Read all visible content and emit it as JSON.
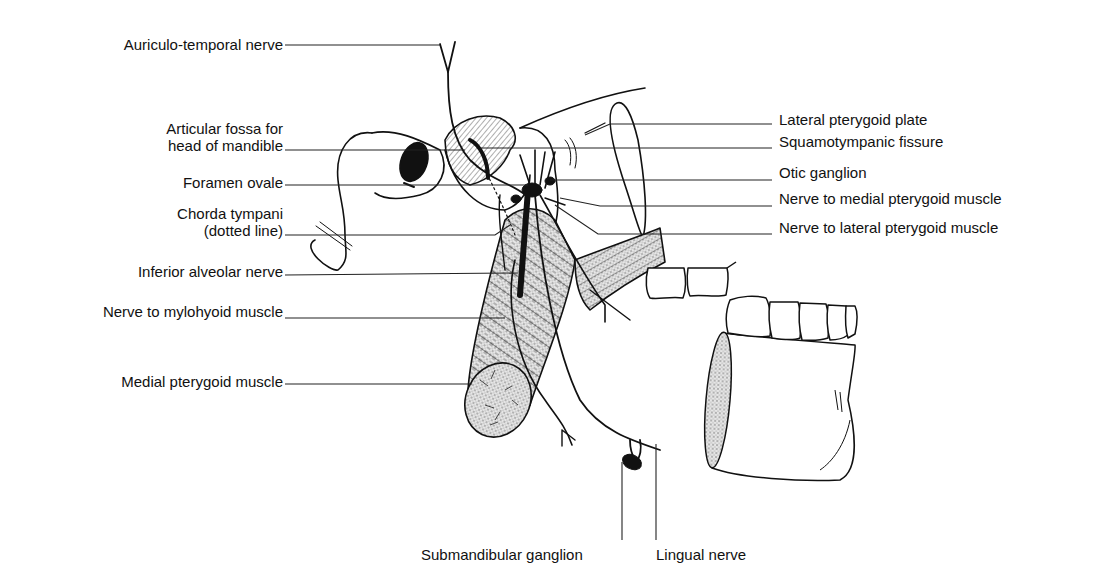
{
  "figure": {
    "line_color": "#111111",
    "shade_color": "#d9d9d9"
  },
  "labels": {
    "left": [
      {
        "id": "auriculo-temporal-nerve",
        "text": "Auriculo-temporal nerve"
      },
      {
        "id": "articular-fossa",
        "line1": "Articular fossa for",
        "line2": "head of mandible"
      },
      {
        "id": "foramen-ovale",
        "text": "Foramen ovale"
      },
      {
        "id": "chorda-tympani",
        "line1": "Chorda tympani",
        "line2": "(dotted line)"
      },
      {
        "id": "inferior-alveolar-nerve",
        "text": "Inferior alveolar nerve"
      },
      {
        "id": "nerve-to-mylohyoid",
        "text": "Nerve to mylohyoid muscle"
      },
      {
        "id": "medial-pterygoid-muscle",
        "text": "Medial pterygoid muscle"
      }
    ],
    "right": [
      {
        "id": "lateral-pterygoid-plate",
        "text": "Lateral pterygoid plate"
      },
      {
        "id": "squamotympanic-fissure",
        "text": "Squamotympanic fissure"
      },
      {
        "id": "otic-ganglion",
        "text": "Otic ganglion"
      },
      {
        "id": "nerve-to-medial-pterygoid",
        "text": "Nerve to medial pterygoid muscle"
      },
      {
        "id": "nerve-to-lateral-pterygoid",
        "text": "Nerve to lateral pterygoid muscle"
      }
    ],
    "bottom": [
      {
        "id": "submandibular-ganglion",
        "text": "Submandibular ganglion"
      },
      {
        "id": "lingual-nerve",
        "text": "Lingual nerve"
      }
    ]
  }
}
